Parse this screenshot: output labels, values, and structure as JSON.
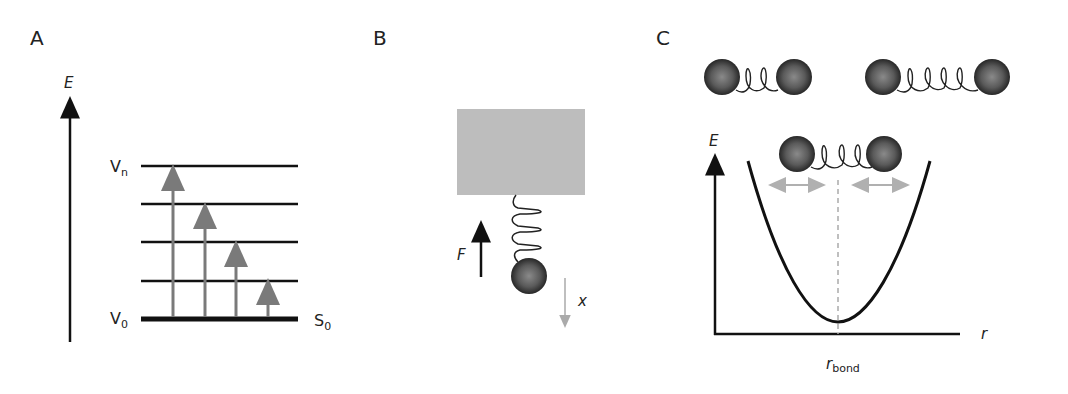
{
  "figure": {
    "panels": [
      {
        "id": "A",
        "label": "A",
        "title": "vibrational energy levels",
        "axis_label": "E",
        "levels": [
          "V_n",
          "",
          "",
          "",
          "V_0"
        ],
        "level_labels": {
          "top": "V",
          "top_sub": "n",
          "bottom": "V",
          "bottom_sub": "0"
        },
        "state_label": "S",
        "state_sub": "0",
        "transitions": 4,
        "colors": {
          "levels": "#111111",
          "transitions": "#7a7a7a"
        }
      },
      {
        "id": "B",
        "label": "B",
        "title": "mass on spring",
        "force_label": "F",
        "displacement_label": "x",
        "spring_loops": 3,
        "colors": {
          "block": "#bdbdbd",
          "force_arrow": "#111111",
          "displacement_arrow": "#a8a8a8"
        }
      },
      {
        "id": "C",
        "label": "C",
        "title": "harmonic potential of a diatomic bond",
        "y_axis_label": "E",
        "x_axis_label": "r",
        "equilibrium_label": "r",
        "equilibrium_sub": "bond",
        "molecules": [
          {
            "state": "compressed",
            "spring_loops": 2
          },
          {
            "state": "stretched",
            "spring_loops": 4
          },
          {
            "state": "equilibrium",
            "spring_loops": 3
          }
        ],
        "colors": {
          "curve": "#111111",
          "dashed_line": "#aaaaaa",
          "double_arrows": "#b0b0b0"
        }
      }
    ]
  }
}
